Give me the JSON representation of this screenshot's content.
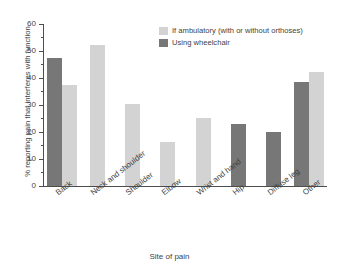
{
  "chart_data": {
    "type": "bar",
    "title": "",
    "xlabel": "Site of pain",
    "ylabel": "% reporting pain that interferes with function",
    "ylim": [
      0,
      60
    ],
    "ytick_labels": [
      "0",
      "10",
      "20",
      "30",
      "40",
      "50",
      "60"
    ],
    "ytick_values": [
      0,
      10,
      20,
      30,
      40,
      50,
      60
    ],
    "grid": false,
    "legend_position": "top-right",
    "categories": [
      "Back",
      "Neck and shoulder",
      "Shoulder",
      "Elbow",
      "Wrist and hand",
      "Hip",
      "Diffuse leg",
      "Other"
    ],
    "series": [
      {
        "name": "If ambulatory (with or without orthoses)",
        "color": "#d3d3d3",
        "values": [
          37.3,
          52.2,
          30.5,
          16.2,
          25.1,
          null,
          null,
          42.4
        ]
      },
      {
        "name": "Using wheelchair",
        "color": "#777777",
        "values": [
          47.3,
          null,
          null,
          null,
          null,
          22.8,
          20.0,
          38.7
        ]
      }
    ]
  },
  "legend": {
    "items": [
      {
        "label": "If ambulatory (with or without orthoses)",
        "swatch": "light"
      },
      {
        "label": "Using wheelchair",
        "swatch": "dark"
      }
    ]
  },
  "axes": {
    "y_title": "% reporting pain that interferes with function",
    "x_title": "Site of pain"
  }
}
